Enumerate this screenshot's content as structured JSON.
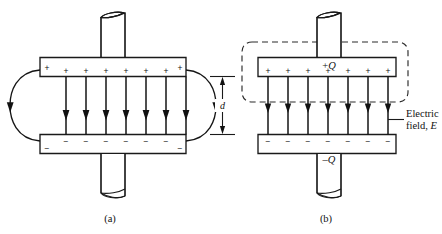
{
  "figure": {
    "background_color": "#ffffff",
    "line_color": "#1a1a1a",
    "dashed_color": "#2a2a2a"
  },
  "panels": [
    {
      "id": "a",
      "caption": "(a)",
      "description": "Parallel-plate capacitor showing uniform interior field and curved fringing field lines at the edges",
      "top_plate": {
        "charge_sign": "+",
        "sign_count": 8,
        "signs": [
          "+",
          "+",
          "+",
          "+",
          "+",
          "+",
          "+",
          "+"
        ]
      },
      "bottom_plate": {
        "charge_sign": "−",
        "sign_count": 8,
        "signs": [
          "−",
          "−",
          "−",
          "−",
          "−",
          "−",
          "−",
          "−"
        ]
      },
      "interior_field_lines": 7,
      "fringing_field_lines": 2,
      "field_direction": "downward",
      "leads": 2
    },
    {
      "id": "b",
      "caption": "(b)",
      "description": "Idealized capacitor with dashed Gaussian surface enclosing the positive plate and uniform field between plates",
      "top_plate": {
        "charge_sign": "+",
        "sign_count": 7,
        "signs": [
          "+",
          "+",
          "+",
          "+",
          "+",
          "+",
          "+"
        ],
        "label_sign": "+",
        "label_symbol": "Q"
      },
      "bottom_plate": {
        "charge_sign": "−",
        "sign_count": 7,
        "signs": [
          "−",
          "−",
          "−",
          "−",
          "−",
          "−",
          "−"
        ],
        "label_sign": "–",
        "label_symbol": "Q"
      },
      "interior_field_lines": 7,
      "field_direction": "downward",
      "gaussian_surface": {
        "style": "dashed",
        "shape": "rounded-rectangle"
      },
      "separation_dimension": {
        "label": "d",
        "orientation": "vertical"
      },
      "field_annotation": {
        "line1": "Electric",
        "line2_prefix": "field, ",
        "line2_symbol": "E"
      },
      "leads": 2
    }
  ]
}
